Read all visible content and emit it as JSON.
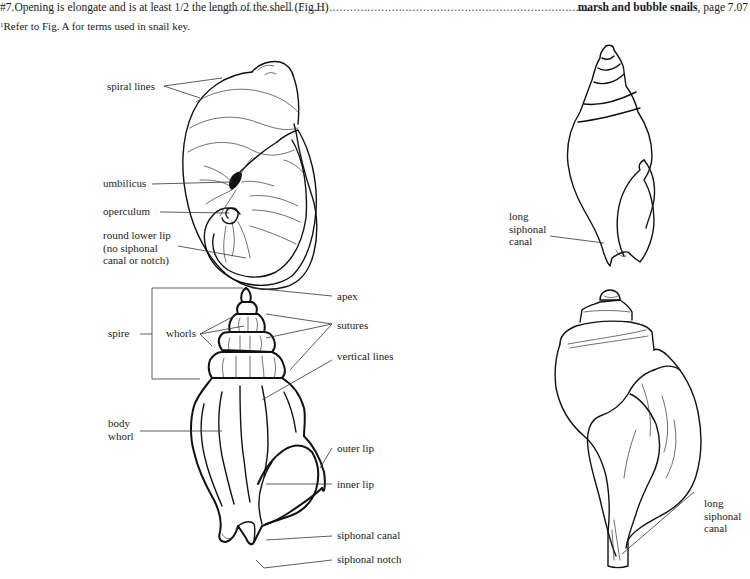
{
  "key_line": {
    "couplet": "#7.",
    "text": "Opening is elongate and is at least 1/2 the length of the shell (Fig.H)",
    "leader": "......................................................................................................................................................",
    "result_bold": "marsh and bubble snails",
    "result_suffix": ", page 7.07"
  },
  "footnote": {
    "marker": "1",
    "text": "Refer to Fig. A for terms used in snail key."
  },
  "figures": {
    "round_shell": {
      "labels": {
        "spiral_lines": "spiral lines",
        "umbilicus": "umbilicus",
        "operculum": "operculum",
        "round_lower_lip": [
          "round lower lip",
          "(no siphonal",
          "canal or notch)"
        ]
      }
    },
    "spiny_shell": {
      "labels": {
        "spire": "spire",
        "whorls": "whorls",
        "apex": "apex",
        "sutures": "sutures",
        "vertical_lines": "vertical  lines",
        "body_whorl": [
          "body",
          "whorl"
        ],
        "outer_lip": "outer lip",
        "inner_lip": "inner lip",
        "siphonal_canal": "siphonal canal",
        "siphonal_notch": "siphonal notch"
      }
    },
    "slender_shell": {
      "labels": {
        "long_siphonal_canal": [
          "long",
          "siphonal",
          "canal"
        ]
      }
    },
    "whelk_shell": {
      "labels": {
        "long_siphonal_canal": [
          "long",
          "siphonal",
          "canal"
        ]
      }
    }
  }
}
